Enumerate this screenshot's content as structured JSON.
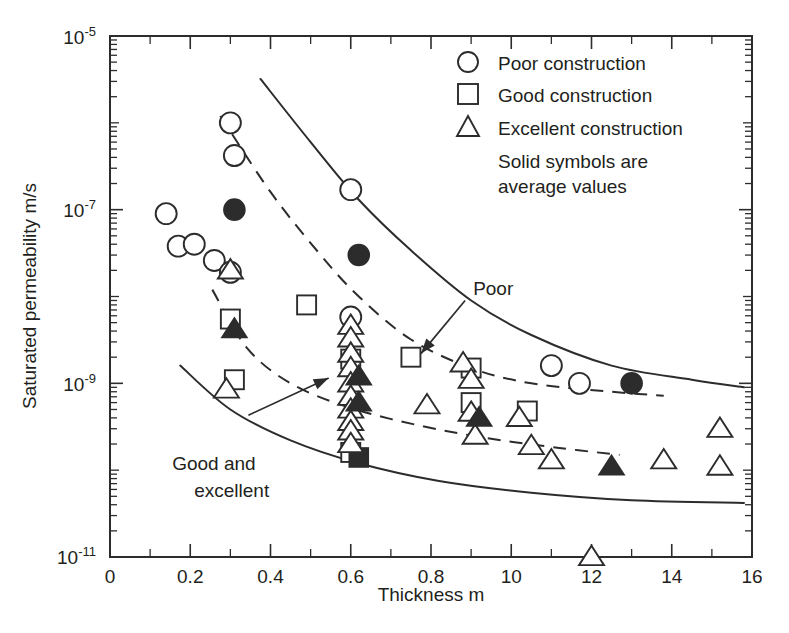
{
  "chart_data": {
    "type": "scatter",
    "title": "",
    "xlabel": "Thickness m",
    "ylabel": "Saturated permeability m/s",
    "xscale": "linear",
    "yscale": "log",
    "xlim": [
      0,
      1.6
    ],
    "ylim": [
      1e-11,
      1e-05
    ],
    "grid": false,
    "xticks": [
      0,
      0.2,
      0.4,
      0.6,
      0.8,
      1.0,
      1.2,
      1.4,
      1.6
    ],
    "xtick_labels": [
      "0",
      "0.2",
      "0.4",
      "0.6",
      "0.8",
      "10",
      "12",
      "14",
      "16"
    ],
    "yticks": [
      1e-05,
      1e-07,
      1e-09,
      1e-11
    ],
    "ytick_labels": [
      "10-5",
      "10-7",
      "10-9",
      "10-11"
    ],
    "ytick_bases": [
      "10",
      "10",
      "10",
      "10"
    ],
    "ytick_exponents": [
      "-5",
      "-7",
      "-9",
      "-11"
    ],
    "legend_position": "top-right",
    "legend_note": "Solid symbols are average values",
    "series": [
      {
        "name": "Poor construction",
        "marker": "circle",
        "fill": "open",
        "points": [
          [
            0.14,
            9e-08
          ],
          [
            0.17,
            3.8e-08
          ],
          [
            0.21,
            4e-08
          ],
          [
            0.26,
            2.6e-08
          ],
          [
            0.3,
            1.9e-08
          ],
          [
            0.3,
            1e-06
          ],
          [
            0.31,
            4.2e-07
          ],
          [
            0.6,
            1.7e-07
          ],
          [
            0.6,
            5.8e-09
          ],
          [
            1.1,
            1.6e-09
          ],
          [
            1.17,
            1e-09
          ]
        ]
      },
      {
        "name": "Poor construction average",
        "marker": "circle",
        "fill": "solid",
        "points": [
          [
            0.31,
            1e-07
          ],
          [
            0.62,
            3e-08
          ],
          [
            1.3,
            1e-09
          ]
        ]
      },
      {
        "name": "Good construction",
        "marker": "square",
        "fill": "open",
        "points": [
          [
            0.3,
            5.5e-09
          ],
          [
            0.31,
            1.1e-09
          ],
          [
            0.49,
            8e-09
          ],
          [
            0.6,
            1.6e-10
          ],
          [
            0.6,
            1.9e-09
          ],
          [
            0.75,
            2e-09
          ],
          [
            0.9,
            1.5e-09
          ],
          [
            0.9,
            6e-10
          ],
          [
            1.04,
            4.8e-10
          ]
        ]
      },
      {
        "name": "Good construction average",
        "marker": "square",
        "fill": "solid",
        "points": [
          [
            0.62,
            1.4e-10
          ]
        ]
      },
      {
        "name": "Excellent construction",
        "marker": "triangle",
        "fill": "open",
        "points": [
          [
            0.3,
            2e-08
          ],
          [
            0.29,
            8.5e-10
          ],
          [
            0.6,
            4.6e-09
          ],
          [
            0.6,
            3.3e-09
          ],
          [
            0.6,
            2.2e-09
          ],
          [
            0.6,
            1.5e-09
          ],
          [
            0.6,
            1e-09
          ],
          [
            0.6,
            7e-10
          ],
          [
            0.6,
            5e-10
          ],
          [
            0.6,
            3.6e-10
          ],
          [
            0.6,
            2.8e-10
          ],
          [
            0.6,
            2e-10
          ],
          [
            0.88,
            1.7e-09
          ],
          [
            0.9,
            1.1e-09
          ],
          [
            0.9,
            4.6e-10
          ],
          [
            0.91,
            2.5e-10
          ],
          [
            0.79,
            5.6e-10
          ],
          [
            1.02,
            4e-10
          ],
          [
            1.05,
            1.9e-10
          ],
          [
            1.1,
            1.3e-10
          ],
          [
            1.2,
            1e-11
          ],
          [
            1.38,
            1.3e-10
          ],
          [
            1.52,
            3e-10
          ],
          [
            1.52,
            1.1e-10
          ]
        ]
      },
      {
        "name": "Excellent construction average",
        "marker": "triangle",
        "fill": "solid",
        "points": [
          [
            0.31,
            4.2e-09
          ],
          [
            0.62,
            1.2e-09
          ],
          [
            0.62,
            6e-10
          ],
          [
            0.92,
            4e-10
          ],
          [
            1.25,
            1.1e-10
          ]
        ]
      }
    ],
    "trend_curves": [
      {
        "name": "poor-upper-solid",
        "style": "solid",
        "label": "Poor",
        "points": [
          [
            0.375,
            3.2e-06
          ],
          [
            0.5,
            6e-07
          ],
          [
            0.62,
            1.3e-07
          ],
          [
            0.75,
            3.4e-08
          ],
          [
            0.9,
            9e-09
          ],
          [
            1.05,
            3.6e-09
          ],
          [
            1.25,
            1.6e-09
          ],
          [
            1.45,
            1.1e-09
          ],
          [
            1.58,
            9e-10
          ]
        ]
      },
      {
        "name": "poor-dashed",
        "style": "dashed",
        "points": [
          [
            0.275,
            1.2e-06
          ],
          [
            0.4,
            1.6e-07
          ],
          [
            0.52,
            3.2e-08
          ],
          [
            0.62,
            1e-08
          ],
          [
            0.75,
            3.2e-09
          ],
          [
            0.9,
            1.5e-09
          ],
          [
            1.05,
            1e-09
          ],
          [
            1.25,
            8e-10
          ],
          [
            1.38,
            7.2e-10
          ]
        ]
      },
      {
        "name": "good-excellent-dashed",
        "style": "dashed",
        "points": [
          [
            0.255,
            1.2e-08
          ],
          [
            0.34,
            2.6e-09
          ],
          [
            0.45,
            1e-09
          ],
          [
            0.6,
            5.2e-10
          ],
          [
            0.78,
            3.2e-10
          ],
          [
            0.95,
            2.3e-10
          ],
          [
            1.12,
            1.8e-10
          ],
          [
            1.27,
            1.5e-10
          ]
        ]
      },
      {
        "name": "good-excellent-lower-solid",
        "style": "solid",
        "label": "Good and excellent",
        "points": [
          [
            0.175,
            1.6e-09
          ],
          [
            0.3,
            5e-10
          ],
          [
            0.45,
            2.2e-10
          ],
          [
            0.62,
            1.2e-10
          ],
          [
            0.82,
            7.5e-11
          ],
          [
            1.05,
            5.5e-11
          ],
          [
            1.3,
            4.5e-11
          ],
          [
            1.58,
            4.2e-11
          ]
        ]
      }
    ],
    "annotations": [
      {
        "name": "poor-annotation",
        "text": "Poor",
        "text_x": 0.905,
        "text_y": 1.05e-08,
        "arrow_from": [
          0.885,
          9e-09
        ],
        "arrow_to": [
          0.775,
          2.2e-09
        ]
      },
      {
        "name": "good-excellent-annotation",
        "text_line_1": "Good and",
        "text_line_2": "excellent",
        "text_x": 0.155,
        "text_y": 1e-10,
        "arrow_from": [
          0.345,
          4.3e-10
        ],
        "arrow_to": [
          0.545,
          1.15e-09
        ]
      }
    ],
    "legend_items": [
      {
        "marker": "circle",
        "label": "Poor construction"
      },
      {
        "marker": "square",
        "label": "Good construction"
      },
      {
        "marker": "triangle",
        "label": "Excellent construction"
      }
    ],
    "legend_note_line_1": "Solid symbols are",
    "legend_note_line_2": "average values"
  },
  "colors": {
    "ink": "#2c2c2c",
    "text": "#231f20",
    "background": "#ffffff"
  }
}
